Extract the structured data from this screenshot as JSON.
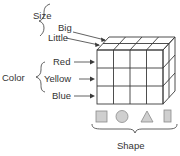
{
  "diagram": {
    "type": "data-cube",
    "dimensions": {
      "size": {
        "label": "Size",
        "values": [
          "Big",
          "Little"
        ]
      },
      "color": {
        "label": "Color",
        "values": [
          "Red",
          "Yellow",
          "Blue"
        ]
      },
      "shape": {
        "label": "Shape",
        "values": [
          "square-icon",
          "circle-icon",
          "triangle-icon",
          "rectangle-icon"
        ]
      }
    },
    "grid": {
      "columns": 4,
      "rows": 3,
      "depth": 2
    },
    "colors": {
      "line": "#3a3a3a",
      "shape_fill": "#cfcfcf",
      "text": "#333333"
    }
  }
}
